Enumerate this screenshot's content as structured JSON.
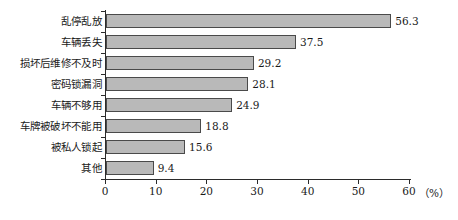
{
  "chart_data": {
    "type": "bar",
    "orientation": "horizontal",
    "title": "",
    "xlabel": "(%)",
    "ylabel": "",
    "categories": [
      "乱停乱放",
      "车辆丢失",
      "损坏后维修不及时",
      "密码锁漏洞",
      "车辆不够用",
      "车牌被破坏不能用",
      "被私人锁起",
      "其他"
    ],
    "values": [
      56.3,
      37.5,
      29.2,
      28.1,
      24.9,
      18.8,
      15.6,
      9.4
    ],
    "value_labels": [
      "56.3",
      "37.5",
      "29.2",
      "28.1",
      "24.9",
      "18.8",
      "15.6",
      "9.4"
    ],
    "xlim": [
      0,
      60
    ],
    "xticks": [
      0,
      10,
      20,
      30,
      40,
      50,
      60
    ],
    "xtick_labels": [
      "0",
      "10",
      "20",
      "30",
      "40",
      "50",
      "60"
    ],
    "grid": false,
    "legend": false,
    "bar_color": "#b9b9b9",
    "bar_border_color": "#4a4a4a",
    "axis_color": "#2b2b2b",
    "text_color": "#1a1a1a",
    "unit_label": "（%）"
  }
}
